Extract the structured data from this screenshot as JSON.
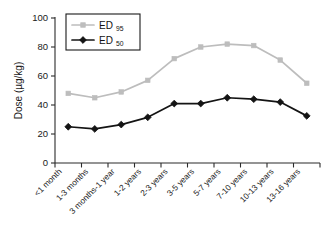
{
  "chart_data": {
    "type": "line",
    "title": "",
    "subtitle": "",
    "xlabel": "",
    "ylabel": "Dose (µg/kg)",
    "ylim": [
      0,
      100
    ],
    "yticks": [
      0,
      20,
      40,
      60,
      80,
      100
    ],
    "grid": false,
    "legend_position": "top-left",
    "categories": [
      "<1 month",
      "1-3 months",
      "3 months-1 year",
      "1-2 years",
      "2-3 years",
      "3-5 years",
      "5-7 years",
      "7-10 years",
      "10-13 years",
      "13-16 years"
    ],
    "series": [
      {
        "name": "ED95",
        "label_base": "ED",
        "label_sub": "95",
        "color": "#bdbdbd",
        "marker": "square",
        "values": [
          48,
          45,
          49,
          57,
          72,
          80,
          82,
          81,
          71,
          55
        ]
      },
      {
        "name": "ED50",
        "label_base": "ED",
        "label_sub": "50",
        "color": "#141414",
        "marker": "diamond",
        "values": [
          25,
          23.5,
          26.5,
          31.5,
          41,
          41,
          45,
          44,
          42,
          32.5
        ]
      }
    ]
  },
  "legend": {
    "entries": [
      {
        "base": "ED",
        "sub": "95"
      },
      {
        "base": "ED",
        "sub": "50"
      }
    ]
  },
  "axis": {
    "y_title": "Dose (µg/kg)",
    "y_tick_labels": [
      "0",
      "20",
      "40",
      "60",
      "80",
      "100"
    ]
  }
}
